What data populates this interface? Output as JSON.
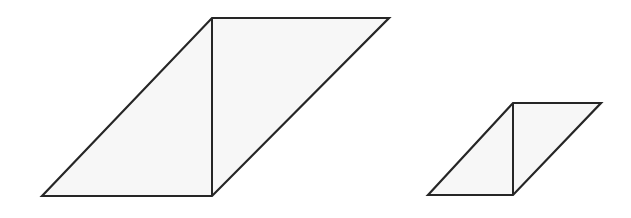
{
  "canvas": {
    "width": 631,
    "height": 218,
    "background_color": "#ffffff"
  },
  "style": {
    "stroke_color": "#262626",
    "fill_color": "#f7f7f7",
    "stroke_width_outer": 2.2,
    "stroke_width_divider": 2.0
  },
  "figures": [
    {
      "name": "large-parallelogram",
      "label": "Large parallelogram divided into two triangles",
      "vertices": {
        "bottom_left": [
          42,
          196
        ],
        "top_left": [
          212,
          18
        ],
        "top_right": [
          389,
          18
        ],
        "bottom_right": [
          212,
          196
        ]
      },
      "outline_points": "42,196 212,18 389,18 212,196",
      "divider_points": "212,18 212,196",
      "left_triangle_points": "42,196 212,18 212,196",
      "right_triangle_points": "212,18 389,18 212,196",
      "base_length": 170,
      "height": 178,
      "slant_run": 170
    },
    {
      "name": "small-parallelogram",
      "label": "Small parallelogram divided into two triangles",
      "vertices": {
        "bottom_left": [
          428,
          195
        ],
        "top_left": [
          513,
          103
        ],
        "top_right": [
          601,
          103
        ],
        "bottom_right": [
          513,
          195
        ]
      },
      "outline_points": "428,195 513,103 601,103 513,195",
      "divider_points": "513,103 513,195",
      "left_triangle_points": "428,195 513,103 513,195",
      "right_triangle_points": "513,103 601,103 513,195",
      "base_length": 85,
      "height": 92,
      "slant_run": 85
    }
  ]
}
